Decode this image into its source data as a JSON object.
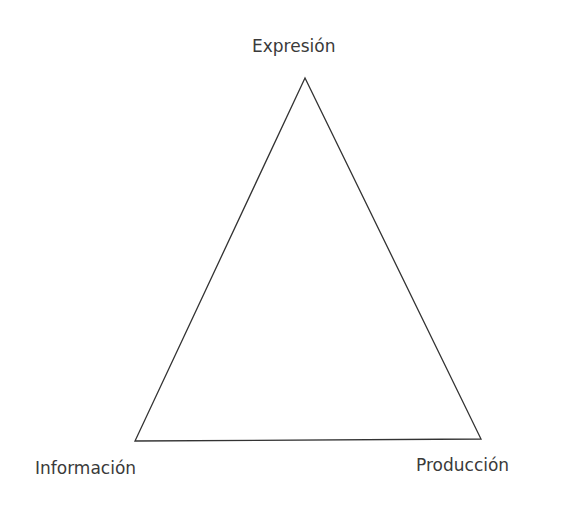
{
  "diagram": {
    "type": "triangle",
    "vertices": {
      "top": "Expresión",
      "bottom_left": "Información",
      "bottom_right": "Producción"
    },
    "colors": {
      "stroke": "#333333",
      "text": "#3a3a3a",
      "background": "#ffffff"
    }
  }
}
